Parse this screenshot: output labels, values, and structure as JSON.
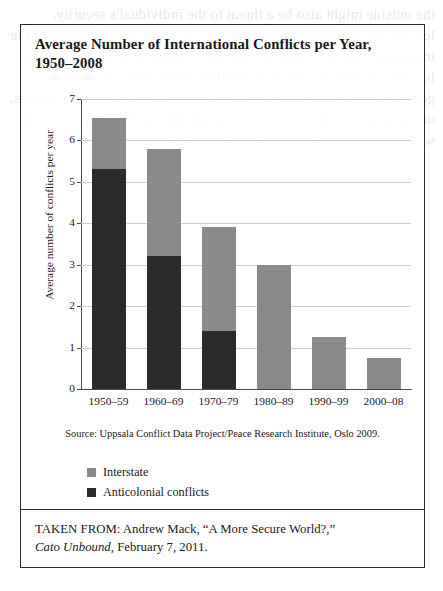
{
  "figure": {
    "title": "Average Number of International Conflicts per Year, 1950–2008",
    "source_note": "Source: Uppsala Conflict Data Project/Peace Research Institute, Oslo 2009.",
    "taken_from_line1": "TAKEN FROM: Andrew Mack, “A More Secure World?,”",
    "taken_from_italic": "Cato Unbound",
    "taken_from_line2_rest": ", February 7, 2011."
  },
  "colors": {
    "interstate": "#8a8a8a",
    "anticolonial": "#2b2b2b",
    "border": "#2a2a2a",
    "gridline": "#cfcfcf",
    "axis": "#4a4a4a"
  },
  "legend": {
    "items": [
      {
        "label": "Interstate",
        "color": "#8a8a8a"
      },
      {
        "label": "Anticolonial conflicts",
        "color": "#2b2b2b"
      }
    ]
  },
  "chart_data": {
    "type": "bar",
    "stacked": true,
    "title": "Average Number of International Conflicts per Year, 1950–2008",
    "xlabel": "",
    "ylabel": "Average number of conflicts per year",
    "ylim": [
      0,
      7
    ],
    "yticks": [
      0,
      1,
      2,
      3,
      4,
      5,
      6,
      7
    ],
    "ytick_labels": [
      "0",
      "1",
      "2",
      "3",
      "4",
      "5",
      "6",
      "7"
    ],
    "grid": true,
    "legend_position": "below-plot-left",
    "categories": [
      "1950–59",
      "1960–69",
      "1970–79",
      "1980–89",
      "1990–99",
      "2000–08"
    ],
    "series": [
      {
        "name": "Anticolonial conflicts",
        "color": "#2b2b2b",
        "values": [
          5.3,
          3.2,
          1.4,
          0,
          0,
          0
        ]
      },
      {
        "name": "Interstate",
        "color": "#8a8a8a",
        "values": [
          1.25,
          2.6,
          2.5,
          3.0,
          1.25,
          0.75
        ]
      }
    ],
    "totals": [
      6.55,
      5.8,
      3.9,
      3.0,
      1.25,
      0.75
    ]
  },
  "bleed_text": "the outside might also be a threat to the individual's security, leaving the individual without refuge or protection. The need of the individual and the victim of violence is immediate. It cannot wait for slow change. Traditional conflicts differ from situations of genocide because they are usually between two armies, two groups, or two nations. Often there are considerable numbers on each side with comparable force and weaponry available."
}
